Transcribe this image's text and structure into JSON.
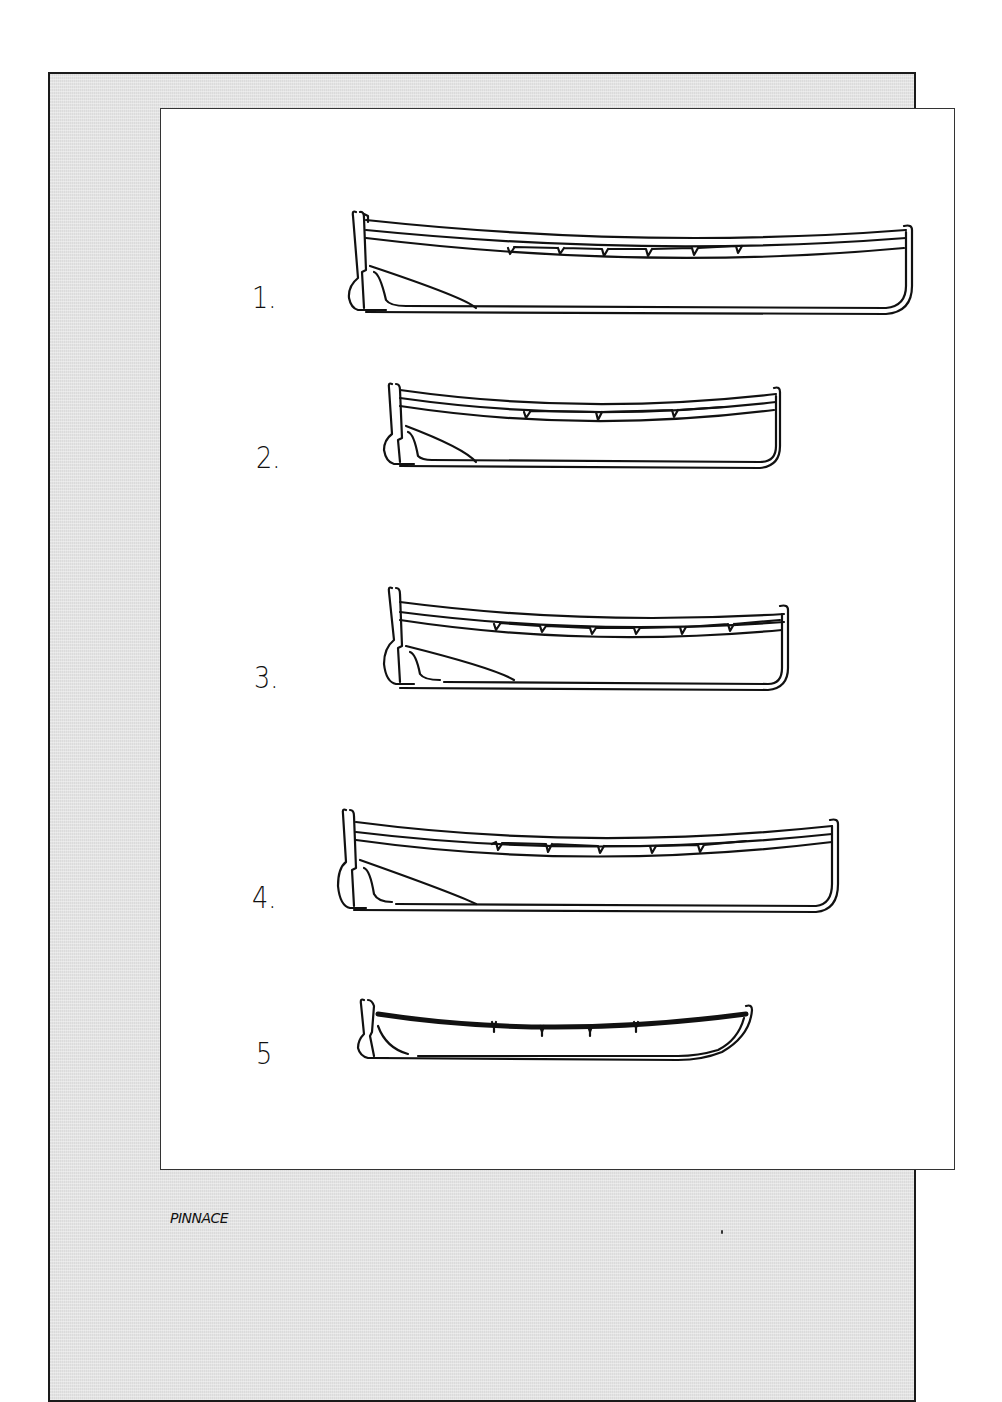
{
  "page": {
    "caption": "PINNACE",
    "colors": {
      "outer_panel": "#e4e4e4",
      "inner_panel": "#ffffff",
      "ink": "#111111"
    }
  },
  "figures": [
    {
      "label": "1.",
      "description": "pinnace profile with six thwart notches"
    },
    {
      "label": "2.",
      "description": "shorter pinnace profile with four thwart notches"
    },
    {
      "label": "3.",
      "description": "pinnace profile with seven thwart notches"
    },
    {
      "label": "4.",
      "description": "pinnace profile with six thwart notches"
    },
    {
      "label": "5",
      "description": "pinnace profile with dark gunwale and four rowlocks"
    }
  ]
}
